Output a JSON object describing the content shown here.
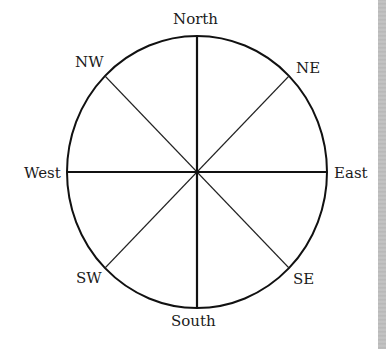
{
  "diagram": {
    "type": "compass-rose",
    "center": [
      197,
      172
    ],
    "radius_x": 130,
    "radius_y": 136,
    "stroke_color": "#111111",
    "background": "#ffffff",
    "side_strip_color": "#bdbdbd",
    "directions": [
      {
        "key": "north",
        "label": "North",
        "angle": 0
      },
      {
        "key": "ne",
        "label": "NE",
        "angle": 45
      },
      {
        "key": "east",
        "label": "East",
        "angle": 90
      },
      {
        "key": "se",
        "label": "SE",
        "angle": 135
      },
      {
        "key": "south",
        "label": "South",
        "angle": 180
      },
      {
        "key": "sw",
        "label": "SW",
        "angle": 225
      },
      {
        "key": "west",
        "label": "West",
        "angle": 270
      },
      {
        "key": "nw",
        "label": "NW",
        "angle": 315
      }
    ]
  },
  "labels": {
    "north": "North",
    "ne": "NE",
    "east": "East",
    "se": "SE",
    "south": "South",
    "sw": "SW",
    "west": "West",
    "nw": "NW"
  }
}
